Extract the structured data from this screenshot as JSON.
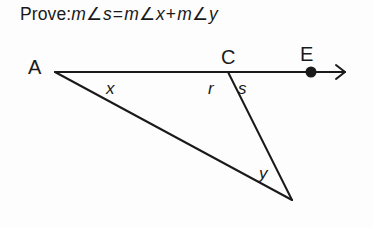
{
  "prove": {
    "lead": "Prove:",
    "m1": "m",
    "angle_sym_1": "∠",
    "var1": "s",
    "equals": "=",
    "m2": "m",
    "angle_sym_2": "∠",
    "var2": "x",
    "plus": "+",
    "m3": "m",
    "angle_sym_3": "∠",
    "var3": "y",
    "full_text": "Prove: m∠s = m∠x + m∠y"
  },
  "diagram": {
    "type": "geometry-figure",
    "stroke_color": "#1a1a1a",
    "background_color": "#fdfdfd",
    "stroke_width": 2,
    "points": {
      "A": {
        "label": "A",
        "x": 55,
        "y": 72,
        "marker": "none"
      },
      "C": {
        "label": "C",
        "x": 228,
        "y": 72,
        "marker": "none"
      },
      "E": {
        "label": "E",
        "x": 311,
        "y": 72,
        "marker": "filled-dot"
      },
      "B": {
        "label": "",
        "x": 292,
        "y": 200,
        "marker": "none"
      }
    },
    "segments": [
      {
        "name": "ray-A-to-E",
        "from": "A",
        "to": "E",
        "extends_to_arrow_x": 345,
        "arrow": true
      },
      {
        "name": "segment-C-to-B",
        "from": "C",
        "to": "B",
        "arrow": false
      },
      {
        "name": "segment-A-to-B",
        "from": "A",
        "to": "B",
        "arrow": false
      }
    ],
    "angle_labels": [
      {
        "name": "x",
        "text": "x",
        "at_vertex": "A",
        "x": 112,
        "y": 88
      },
      {
        "name": "r",
        "text": "r",
        "at_vertex": "C",
        "x": 213,
        "y": 88
      },
      {
        "name": "s",
        "text": "s",
        "at_vertex": "C",
        "x": 243,
        "y": 88
      },
      {
        "name": "y",
        "text": "y",
        "at_vertex": "B",
        "x": 265,
        "y": 173
      }
    ]
  }
}
